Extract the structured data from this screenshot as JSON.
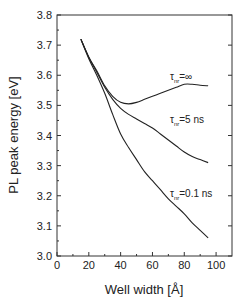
{
  "chart_data": {
    "type": "line",
    "title": "",
    "xlabel": "Well width [Å]",
    "ylabel": "PL peak energy [eV]",
    "xlim": [
      0,
      110
    ],
    "ylim": [
      3.0,
      3.8
    ],
    "xticks": [
      0,
      20,
      40,
      60,
      80,
      100
    ],
    "yticks": [
      3.0,
      3.1,
      3.2,
      3.3,
      3.4,
      3.5,
      3.6,
      3.7,
      3.8
    ],
    "grid": false,
    "legend": "inline annotations",
    "series": [
      {
        "name": "τnr=∞",
        "label_main": "τ",
        "label_sub": "nr",
        "label_rest": "=∞",
        "x": [
          15,
          20,
          25,
          30,
          35,
          40,
          45,
          50,
          55,
          60,
          65,
          70,
          75,
          80,
          85,
          90,
          95
        ],
        "y": [
          3.72,
          3.66,
          3.615,
          3.565,
          3.53,
          3.51,
          3.505,
          3.51,
          3.52,
          3.53,
          3.54,
          3.55,
          3.56,
          3.57,
          3.57,
          3.567,
          3.565
        ]
      },
      {
        "name": "τnr=5 ns",
        "label_main": "τ",
        "label_sub": "nr",
        "label_rest": "=5 ns",
        "x": [
          15,
          20,
          25,
          30,
          35,
          40,
          45,
          50,
          55,
          60,
          65,
          70,
          75,
          80,
          85,
          90,
          95
        ],
        "y": [
          3.72,
          3.66,
          3.61,
          3.56,
          3.52,
          3.49,
          3.47,
          3.455,
          3.44,
          3.425,
          3.405,
          3.385,
          3.365,
          3.345,
          3.33,
          3.32,
          3.31
        ]
      },
      {
        "name": "τnr=0.1 ns",
        "label_main": "τ",
        "label_sub": "nr",
        "label_rest": "=0.1 ns",
        "x": [
          15,
          20,
          25,
          30,
          35,
          40,
          45,
          50,
          55,
          60,
          65,
          70,
          75,
          80,
          85,
          90,
          95
        ],
        "y": [
          3.72,
          3.655,
          3.6,
          3.54,
          3.47,
          3.405,
          3.36,
          3.32,
          3.28,
          3.25,
          3.22,
          3.19,
          3.165,
          3.14,
          3.11,
          3.085,
          3.06
        ]
      }
    ],
    "annotations": [
      {
        "series": 0,
        "x": 71,
        "y": 3.585
      },
      {
        "series": 1,
        "x": 71,
        "y": 3.44
      },
      {
        "series": 2,
        "x": 71,
        "y": 3.195
      }
    ]
  }
}
